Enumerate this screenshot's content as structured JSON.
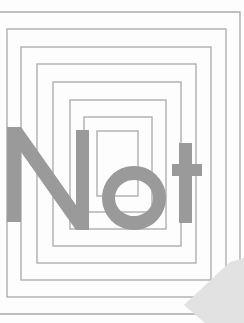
{
  "cover": {
    "title": "Not",
    "background_color": "#fdfdfd",
    "line_color": "#a9a9a9",
    "text_color": "#9a9a9a",
    "curl_color": "#e2e2e2"
  },
  "frames": [
    {
      "x1": 0,
      "y1": 12,
      "x2": 240,
      "y2": 314,
      "open": "left"
    },
    {
      "x1": 7,
      "y1": 29,
      "x2": 226,
      "y2": 297
    },
    {
      "x1": 21,
      "y1": 47,
      "x2": 211,
      "y2": 280
    },
    {
      "x1": 37,
      "y1": 64,
      "x2": 196,
      "y2": 263
    },
    {
      "x1": 53,
      "y1": 82,
      "x2": 181,
      "y2": 246
    },
    {
      "x1": 70,
      "y1": 100,
      "x2": 166,
      "y2": 229
    },
    {
      "x1": 84,
      "y1": 117,
      "x2": 152,
      "y2": 212
    },
    {
      "x1": 97,
      "y1": 131,
      "x2": 138,
      "y2": 196
    }
  ]
}
